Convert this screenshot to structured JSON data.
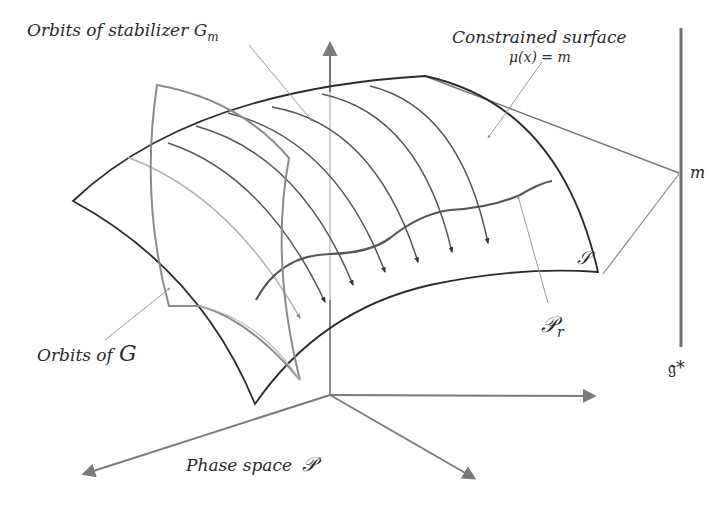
{
  "diagram": {
    "type": "symplectic-reduction-illustration",
    "labels": {
      "stabilizer_orbits": "Orbits of  stabilizer G",
      "stabilizer_sub": "m",
      "constrained_surface": "Constrained surface",
      "momentum_equation": "μ(x) = m",
      "orbits_of_g": "Orbits  of",
      "orbits_of_g_symbol": "G",
      "phase_space": "Phase space",
      "phase_space_symbol": "𝒫",
      "surface_symbol": "𝒮",
      "reduced_space_symbol": "𝒫",
      "reduced_space_sub": "r",
      "dual_algebra_point": "m",
      "dual_algebra": "𝔤*"
    },
    "colors": {
      "surface_edge": "#2b2b2b",
      "orbit_curves": "#555555",
      "orbit_g_surface": "#8a8a8a",
      "axes": "#7a7a7a",
      "leader_lines": "#9a9a9a",
      "light_curve": "#b5b5b5",
      "background": "#ffffff"
    }
  }
}
